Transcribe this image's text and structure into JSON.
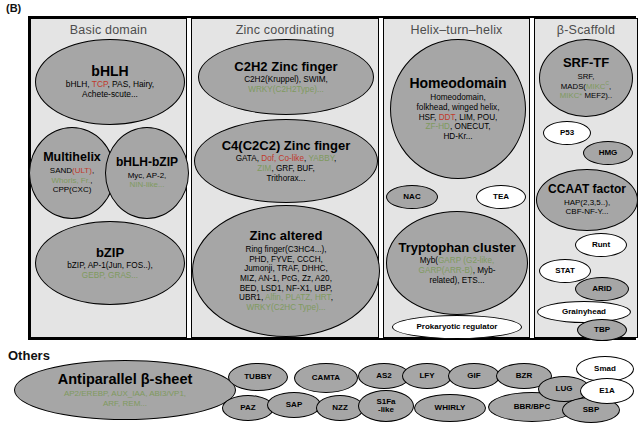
{
  "figure": {
    "panel_label": "(B)",
    "others_label": "Others"
  },
  "columns": [
    {
      "title": "Basic domain"
    },
    {
      "title": "Zinc  coordinating"
    },
    {
      "title": "Helix–turn–helix"
    },
    {
      "title": "β-Scaffold"
    }
  ],
  "basic_domain": {
    "bhlh": {
      "head": "bHLH",
      "line1_a": "bHLH, ",
      "line1_r": "TCP",
      "line1_b": ", PAS, Hairy,",
      "line2": "Achete-scute..."
    },
    "multihelix": {
      "head": "Multihelix",
      "l1_a": "SAND",
      "l1_r": "(ULT)",
      "l1_b": ",",
      "l2_g": "Whorls, Fr.",
      "l2_b": ",",
      "l3": "CPP(CXC)"
    },
    "bhlh_bzip": {
      "head": "bHLH-bZIP",
      "l1": "Myc, AP-2,",
      "l2_g": "NIN-like..."
    },
    "bzip": {
      "head": "bZIP",
      "l1": "bZIP, AP-1(Jun, FOS..),",
      "l2_g": "GEBP, GRAS..."
    }
  },
  "zinc_coordinating": {
    "c2h2": {
      "head": "C2H2 Zinc finger",
      "l1": "C2H2(Kruppel), SWIM,",
      "l2_g": "WRKY(C2H2Type)..."
    },
    "c4": {
      "head": "C4(C2C2) Zinc finger",
      "l1_a": "GATA, ",
      "l1_r": "Dof, Co-like",
      "l1_b": ", ",
      "l1_g": "YABBY",
      "l1_c": ",",
      "l2_g": "ZIM",
      "l2_b": ", GRF, BUF,",
      "l3": "Trithorax..."
    },
    "zinc_altered": {
      "head": "Zinc altered",
      "l1": "Ring finger(C3HC4...),",
      "l2": "PHD, FYVE, CCCH,",
      "l3": "Jumonji, TRAF, DHHC,",
      "l4": "MIZ, AN-1, PcG, Zz, A20,",
      "l5": "BED, LSD1, NF-X1, UBP,",
      "l6_a": "UBR1, ",
      "l6_g": "Alfin, PLATZ, HRT",
      "l6_b": ",",
      "l7_g": "WRKY(C2HC Type)..."
    }
  },
  "helix_turn_helix": {
    "homeodomain": {
      "head": "Homeodomain",
      "l1": "Homeodomain,",
      "l2": "folkhead, winged helix,",
      "l3_a": "HSF, ",
      "l3_r": "DDT",
      "l3_b": ", LIM, POU,",
      "l4_g": "ZF-HD",
      "l4_b": ", ONECUT,",
      "l5": "HD-Kr..."
    },
    "nac": "NAC",
    "tea": "TEA",
    "tryptophan": {
      "head": "Tryptophan cluster",
      "l1_a": "Myb(",
      "l1_g": "GARP (G2-like,",
      "l2_g": "GARP(ARR-B)",
      "l2_b": ", Myb-",
      "l3": "related), ETS..."
    },
    "prokaryotic": "Prokaryotic regulator"
  },
  "beta_scaffold": {
    "srf": {
      "head": "SRF-TF",
      "l1": "SRF,",
      "l2_a": "MADS(",
      "l2_g": "MIKC",
      "l2_sup": "C",
      "l2_b": ",",
      "l3_g": "MIKC*",
      "l3_b": " MEF2).."
    },
    "p53": "P53",
    "hmg": "HMG",
    "ccaat": {
      "head": "CCAAT factor",
      "l1": "HAP(2,3,5..),",
      "l2": "CBF-NF-Y..."
    },
    "runt": "Runt",
    "stat": "STAT",
    "arid": "ARID",
    "grainyhead": "Grainyhead",
    "tbp": "TBP"
  },
  "others": {
    "antiparallel": {
      "head": "Antiparallel β-sheet",
      "l1_g": "AP2/EREBP, AUX_IAA, ABI3/VP1,",
      "l2_g": "ARF, REM..."
    },
    "tubby": "TUBBY",
    "camta": "CAMTA",
    "paz": "PAZ",
    "sap": "SAP",
    "nzz": "NZZ",
    "as2": "AS2",
    "lfy": "LFY",
    "gif": "GIF",
    "bzr": "BZR",
    "s1fa_l1": "S1Fa",
    "s1fa_l2": "-like",
    "whirly": "WHIRLY",
    "bbr_bpc": "BBR/BPC",
    "lug": "LUG",
    "sbp": "SBP",
    "smad": "Smad",
    "e1a": "E1A"
  }
}
